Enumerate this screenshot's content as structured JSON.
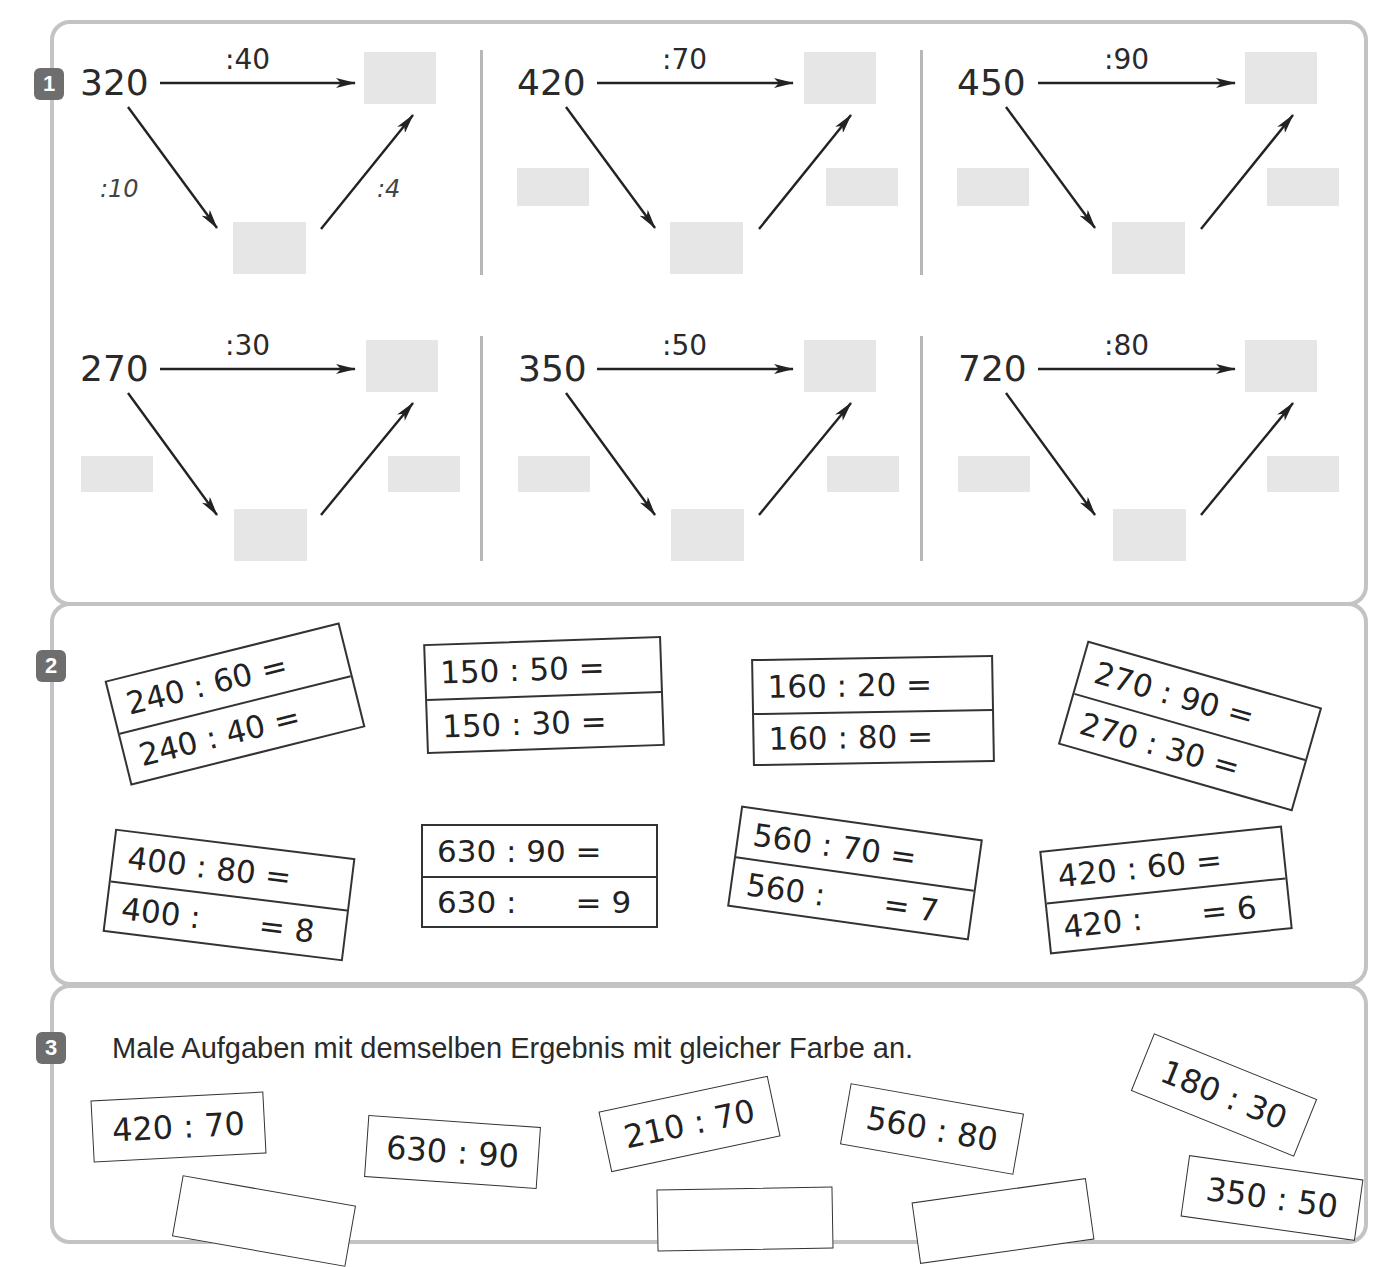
{
  "colors": {
    "badge": "#6e6e6e",
    "panel_border": "#c3c3c3",
    "answer_box": "#e6e6e6"
  },
  "exercise1": {
    "badge": "1",
    "diagrams": [
      {
        "start": "320",
        "top_op": ":40",
        "left_op": ":10",
        "right_op": ":4"
      },
      {
        "start": "420",
        "top_op": ":70",
        "left_op": "",
        "right_op": ""
      },
      {
        "start": "450",
        "top_op": ":90",
        "left_op": "",
        "right_op": ""
      },
      {
        "start": "270",
        "top_op": ":30",
        "left_op": "",
        "right_op": ""
      },
      {
        "start": "350",
        "top_op": ":50",
        "left_op": "",
        "right_op": ""
      },
      {
        "start": "720",
        "top_op": ":80",
        "left_op": "",
        "right_op": ""
      }
    ]
  },
  "exercise2": {
    "badge": "2",
    "cards": [
      {
        "line1": "240 : 60 =",
        "line2": "240 : 40 ="
      },
      {
        "line1": "150 : 50 =",
        "line2": "150 : 30 ="
      },
      {
        "line1": "160 : 20 =",
        "line2": "160 : 80 ="
      },
      {
        "line1": "270 : 90 =",
        "line2": "270 : 30 ="
      },
      {
        "line1": "400 : 80 =",
        "line2": "400 :      = 8"
      },
      {
        "line1": "630 : 90 =",
        "line2": "630 :      = 9"
      },
      {
        "line1": "560 : 70 =",
        "line2": "560 :      = 7"
      },
      {
        "line1": "420 : 60 =",
        "line2": "420 :      = 6"
      }
    ]
  },
  "exercise3": {
    "badge": "3",
    "instruction": "Male Aufgaben mit demselben Ergebnis mit gleicher Farbe an.",
    "tiles": [
      "420 : 70",
      "630 : 90",
      "210 : 70",
      "560 : 80",
      "180 : 30",
      "350 : 50",
      "",
      "",
      "",
      ""
    ]
  }
}
